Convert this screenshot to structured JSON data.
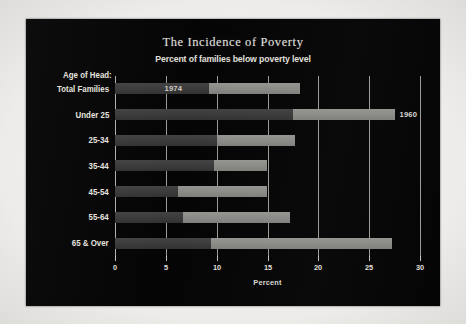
{
  "chart_data": {
    "type": "bar",
    "orientation": "horizontal",
    "title": "The Incidence of Poverty",
    "subtitle": "Percent of families below poverty level",
    "xlabel": "Percent",
    "ylabel": "Age of Head:",
    "xlim": [
      0,
      30
    ],
    "xticks": [
      0,
      5,
      10,
      15,
      20,
      25,
      30
    ],
    "xticklabels": [
      "0",
      "5",
      "10",
      "15",
      "20",
      "25",
      "30"
    ],
    "grid": true,
    "grid_axis": "x",
    "legend": "inline-annotations",
    "categories": [
      "Total Families",
      "Under 25",
      "25-34",
      "35-44",
      "45-54",
      "55-64",
      "65 & Over"
    ],
    "series": [
      {
        "name": "1974",
        "color": "#3a3a3a",
        "values": [
          9.2,
          17.5,
          10.0,
          9.7,
          6.2,
          6.7,
          9.4
        ]
      },
      {
        "name": "1960",
        "color": "#8a8a86",
        "values": [
          18.2,
          27.5,
          17.7,
          15.0,
          15.0,
          17.2,
          27.2
        ]
      }
    ],
    "annotations": [
      {
        "text": "1974",
        "row": 0,
        "placement": "inside-dark"
      },
      {
        "text": "1960",
        "row": 1,
        "placement": "outside-right"
      }
    ]
  },
  "panel": {
    "background": "#050505",
    "text_color": "#e2e0dc",
    "grid_color": "#b9b6b1"
  }
}
